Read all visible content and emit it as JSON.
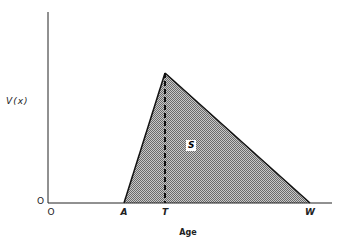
{
  "diagram": {
    "y_axis_label": "V(x)",
    "y_origin_label": "O",
    "x_axis_title": "Age",
    "x_ticks": [
      {
        "label": "O",
        "x": 51
      },
      {
        "label": "A",
        "x": 124
      },
      {
        "label": "T",
        "x": 165
      },
      {
        "label": "W",
        "x": 310
      }
    ],
    "region_label": "S",
    "colors": {
      "line": "#111111",
      "fill": "#9a9a9a",
      "background": "#ffffff"
    },
    "shape": {
      "type": "triangle",
      "vertices": [
        "A",
        "peak at T",
        "W"
      ],
      "dashed_line": "vertical from peak at T down to axis"
    }
  }
}
